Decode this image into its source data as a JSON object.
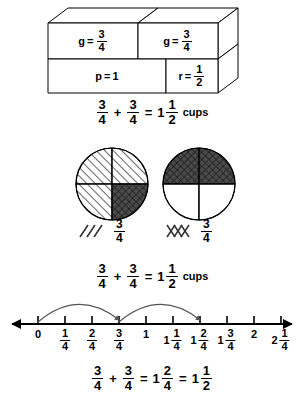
{
  "figure": {
    "box_model": {
      "top_row": [
        {
          "var": "g",
          "eq": "=",
          "value_num": "3",
          "value_den": "4"
        },
        {
          "var": "g",
          "eq": "=",
          "value_num": "3",
          "value_den": "4"
        }
      ],
      "bottom_row": [
        {
          "var": "p",
          "eq": "=",
          "value": "1"
        },
        {
          "var": "r",
          "eq": "=",
          "value_num": "1",
          "value_den": "2"
        }
      ]
    },
    "equations": {
      "top": {
        "a_num": "3",
        "a_den": "4",
        "plus": "+",
        "b_num": "3",
        "b_den": "4",
        "equals": "=",
        "sum_whole": "1",
        "sum_num": "1",
        "sum_den": "2",
        "unit": "cups"
      },
      "middle": {
        "a_num": "3",
        "a_den": "4",
        "plus": "+",
        "b_num": "3",
        "b_den": "4",
        "equals": "=",
        "sum_whole": "1",
        "sum_num": "1",
        "sum_den": "2",
        "unit": "cups"
      },
      "bottom": {
        "a_num": "3",
        "a_den": "4",
        "plus": "+",
        "b_num": "3",
        "b_den": "4",
        "equals": "=",
        "sum1_whole": "1",
        "sum1_num": "2",
        "sum1_den": "4",
        "equals2": "=",
        "sum2_whole": "1",
        "sum2_num": "1",
        "sum2_den": "2"
      }
    },
    "circle_models": {
      "left": {
        "name": "first-three-fourths-circle",
        "quadrants": [
          "diagonal",
          "diagonal",
          "diagonal",
          "crosshatch"
        ],
        "legend": {
          "pattern": "diagonal",
          "num": "3",
          "den": "4"
        }
      },
      "right": {
        "name": "second-three-fourths-circle",
        "quadrants": [
          "crosshatch",
          "crosshatch",
          "empty",
          "empty"
        ],
        "legend": {
          "pattern": "crosshatch",
          "num": "3",
          "den": "4"
        }
      }
    },
    "number_line": {
      "ticks": [
        {
          "whole": "0",
          "num": "",
          "den": ""
        },
        {
          "whole": "",
          "num": "1",
          "den": "4"
        },
        {
          "whole": "",
          "num": "2",
          "den": "4"
        },
        {
          "whole": "",
          "num": "3",
          "den": "4"
        },
        {
          "whole": "1",
          "num": "",
          "den": ""
        },
        {
          "whole": "1",
          "num": "1",
          "den": "4"
        },
        {
          "whole": "1",
          "num": "2",
          "den": "4"
        },
        {
          "whole": "1",
          "num": "3",
          "den": "4"
        },
        {
          "whole": "2",
          "num": "",
          "den": ""
        },
        {
          "whole": "2",
          "num": "1",
          "den": "4"
        }
      ],
      "jumps": [
        {
          "from_index": 0,
          "to_index": 3,
          "label": "first jump of three fourths"
        },
        {
          "from_index": 3,
          "to_index": 6,
          "label": "second jump of three fourths"
        }
      ]
    },
    "colors": {
      "stroke": "#000000",
      "background": "#ffffff",
      "crosshatch_fill": "#4a4a4a",
      "arc": "#555555"
    }
  }
}
